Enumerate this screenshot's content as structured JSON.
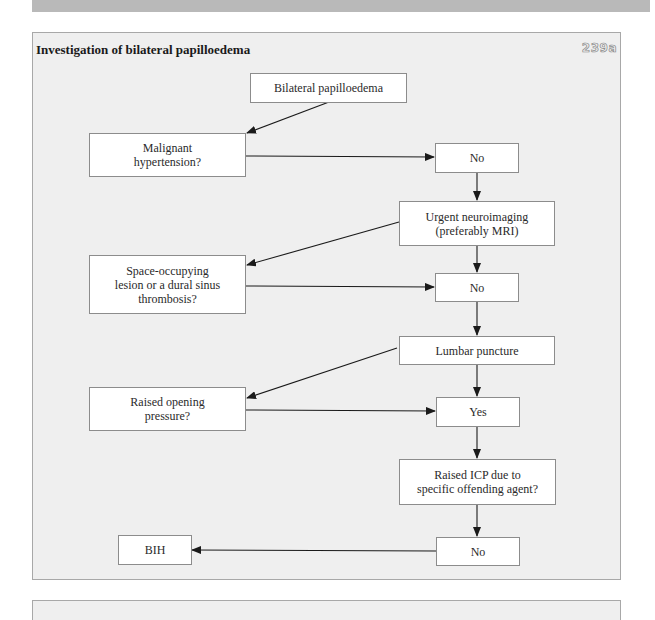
{
  "figure": {
    "title": "Investigation of bilateral papilloedema",
    "number": "239a"
  },
  "nodes": {
    "start": "Bilateral papilloedema",
    "malignant": "Malignant\nhypertension?",
    "no1": "No",
    "neuroimaging": "Urgent neuroimaging\n(preferably MRI)",
    "space": "Space-occupying\nlesion or a dural sinus\nthrombosis?",
    "no2": "No",
    "lumbar": "Lumbar puncture",
    "opening": "Raised opening\npressure?",
    "yes": "Yes",
    "icp": "Raised ICP due to\nspecific offending agent?",
    "no3": "No",
    "bih": "BIH"
  },
  "edges": [
    {
      "from": "start",
      "to": "malignant"
    },
    {
      "from": "malignant",
      "to": "no1"
    },
    {
      "from": "no1",
      "to": "neuroimaging"
    },
    {
      "from": "neuroimaging",
      "to": "space"
    },
    {
      "from": "neuroimaging",
      "to": "no2"
    },
    {
      "from": "space",
      "to": "no2"
    },
    {
      "from": "no2",
      "to": "lumbar"
    },
    {
      "from": "lumbar",
      "to": "opening"
    },
    {
      "from": "lumbar",
      "to": "yes"
    },
    {
      "from": "opening",
      "to": "yes"
    },
    {
      "from": "yes",
      "to": "icp"
    },
    {
      "from": "icp",
      "to": "no3"
    },
    {
      "from": "no3",
      "to": "bih"
    }
  ],
  "colors": {
    "panel_bg": "#efefef",
    "box_bg": "#ffffff",
    "border": "#8c8c8c",
    "arrow": "#1a1a1a",
    "top_strip": "#b9b9b9"
  }
}
